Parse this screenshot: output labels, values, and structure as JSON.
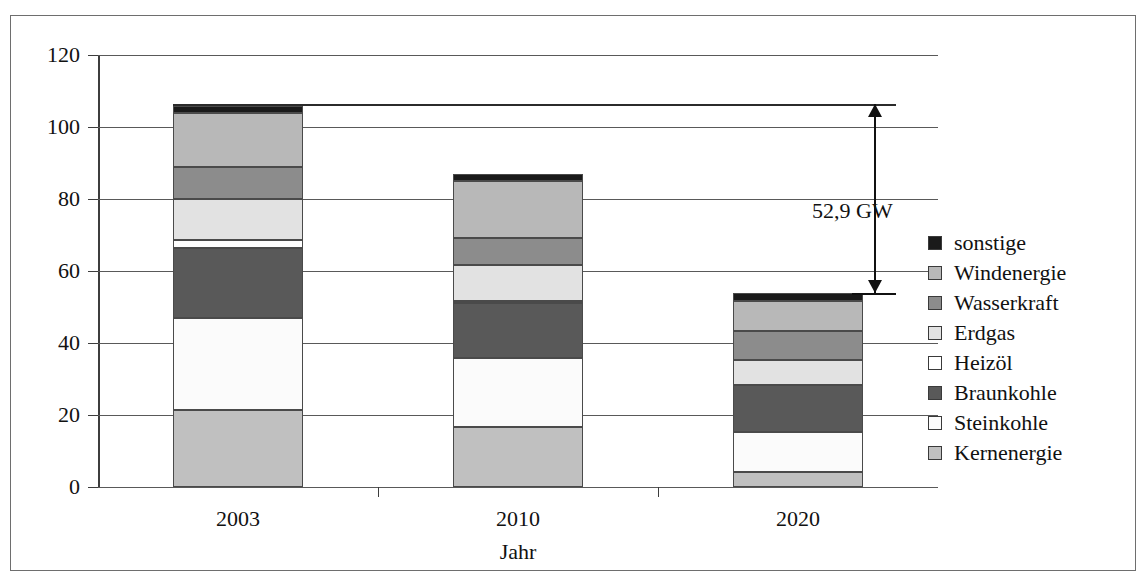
{
  "chart_data": {
    "type": "bar",
    "subtype": "stacked-column",
    "title": "",
    "xlabel": "Jahr",
    "ylabel": "",
    "categories": [
      "2003",
      "2010",
      "2020"
    ],
    "ylim": [
      0,
      120
    ],
    "yticks": [
      0,
      20,
      40,
      60,
      80,
      100,
      120
    ],
    "grid": true,
    "legend_position": "right",
    "unit": "GW",
    "series": [
      {
        "name": "Kernenergie",
        "color": "#c0c0c0",
        "values": [
          21.5,
          16.7,
          4.2
        ]
      },
      {
        "name": "Steinkohle",
        "color": "#fbfbfb",
        "values": [
          25.5,
          19.0,
          11.0
        ]
      },
      {
        "name": "Braunkohle",
        "color": "#595959",
        "values": [
          19.5,
          15.5,
          13.0
        ]
      },
      {
        "name": "Heizöl",
        "color": "#ffffff",
        "values": [
          2.0,
          0.6,
          0.0
        ]
      },
      {
        "name": "Erdgas",
        "color": "#e2e2e2",
        "values": [
          11.5,
          10.0,
          7.0
        ]
      },
      {
        "name": "Wasserkraft",
        "color": "#8c8c8c",
        "values": [
          9.0,
          7.5,
          8.0
        ]
      },
      {
        "name": "Windenergie",
        "color": "#b8b8b8",
        "values": [
          15.0,
          15.8,
          8.6
        ]
      },
      {
        "name": "sonstige",
        "color": "#1a1a1a",
        "values": [
          1.9,
          1.9,
          2.1
        ]
      }
    ],
    "totals": [
      106.4,
      86.9,
      53.9
    ],
    "legend_order": [
      "sonstige",
      "Windenergie",
      "Wasserkraft",
      "Erdgas",
      "Heizöl",
      "Braunkohle",
      "Steinkohle",
      "Kernenergie"
    ],
    "annotations": [
      {
        "name": "difference-arrow",
        "label": "52,9 GW",
        "from": 106.4,
        "to": 53.9,
        "value": 52.9
      }
    ]
  }
}
